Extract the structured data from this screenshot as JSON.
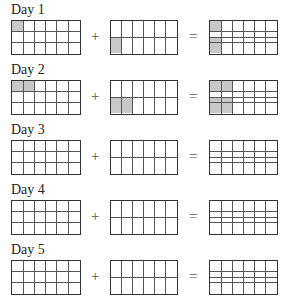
{
  "operators": {
    "plus": "+",
    "equals": "="
  },
  "grid": {
    "columns": 6,
    "left_rows": 3,
    "middle_rows": 2,
    "right_lines": [
      0.333,
      0.5,
      0.667
    ]
  },
  "colors": {
    "shade": "#c8c8c8",
    "line": "#555555",
    "border": "#333333"
  },
  "days": [
    {
      "label": "Day 1",
      "left_shaded_cols": 1,
      "middle_shaded_cols": 1,
      "right_top_shaded_cols": 1,
      "right_bottom_shaded_cols": 1
    },
    {
      "label": "Day 2",
      "left_shaded_cols": 2,
      "middle_shaded_cols": 2,
      "right_top_shaded_cols": 2,
      "right_bottom_shaded_cols": 2
    },
    {
      "label": "Day 3",
      "left_shaded_cols": 0,
      "middle_shaded_cols": 0,
      "right_top_shaded_cols": 0,
      "right_bottom_shaded_cols": 0
    },
    {
      "label": "Day 4",
      "left_shaded_cols": 0,
      "middle_shaded_cols": 0,
      "right_top_shaded_cols": 0,
      "right_bottom_shaded_cols": 0
    },
    {
      "label": "Day 5",
      "left_shaded_cols": 0,
      "middle_shaded_cols": 0,
      "right_top_shaded_cols": 0,
      "right_bottom_shaded_cols": 0
    }
  ]
}
